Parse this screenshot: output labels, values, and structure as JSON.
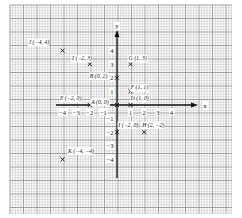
{
  "diagram": {
    "type": "coordinate-plane",
    "grid": {
      "left": 10,
      "top": 5,
      "right": 232,
      "bottom": 214,
      "minor_step": 2.7,
      "major_every": 5,
      "minor_color": "#bdbdbd",
      "major_color": "#8a8a8a",
      "paper_color": "#ffffff"
    },
    "origin_px": {
      "x": 117,
      "y": 105
    },
    "unit_px": 13.6,
    "axes": {
      "x_label": "x",
      "y_label": "y",
      "axis_color": "#111111",
      "x_start_px": 56,
      "x_end_px": 198,
      "y_top_px": 30,
      "y_bottom_px": 178,
      "x_ticks": [
        {
          "v": -4,
          "label": "−4"
        },
        {
          "v": -3,
          "label": "−3"
        },
        {
          "v": -2,
          "label": "−2"
        },
        {
          "v": -1,
          "label": "−1"
        },
        {
          "v": 1,
          "label": "1"
        },
        {
          "v": 2,
          "label": "2"
        },
        {
          "v": 3,
          "label": "3"
        },
        {
          "v": 4,
          "label": "4"
        }
      ],
      "y_ticks": [
        {
          "v": 4,
          "label": "4"
        },
        {
          "v": 3,
          "label": "3"
        },
        {
          "v": 2,
          "label": "2"
        },
        {
          "v": 1,
          "label": "1"
        },
        {
          "v": -1,
          "label": "−1"
        },
        {
          "v": -2,
          "label": "−2"
        },
        {
          "v": -3,
          "label": "−3"
        },
        {
          "v": -4,
          "label": "−4"
        }
      ]
    },
    "points": [
      {
        "id": "J",
        "label": "J (−4, 4)",
        "x": -4,
        "y": 4,
        "lx": -6.5,
        "ly": 4.5
      },
      {
        "id": "I1",
        "label": "I (−2, 3)",
        "x": -2,
        "y": 3,
        "lx": -3.3,
        "ly": 3.3
      },
      {
        "id": "G",
        "label": "G (1, 3)",
        "x": 1,
        "y": 3,
        "lx": 0.85,
        "ly": 3.3
      },
      {
        "id": "B",
        "label": "B (0, 2)",
        "x": 0,
        "y": 2,
        "lx": -2.0,
        "ly": 2.0
      },
      {
        "id": "F",
        "label": "F (1, 1)",
        "x": 1,
        "y": 1,
        "lx": 1.0,
        "ly": 1.15
      },
      {
        "id": "D",
        "label": "D (1, 0)",
        "x": 1,
        "y": 0,
        "lx": 1.0,
        "ly": 0.35
      },
      {
        "id": "E",
        "label": "E (−2, 0)",
        "x": -2,
        "y": 0,
        "lx": -4.2,
        "ly": 0.35
      },
      {
        "id": "A",
        "label": "A (0, 0)",
        "x": 0,
        "y": 0,
        "lx": -1.9,
        "ly": 0.1
      },
      {
        "id": "I2",
        "label": "I (−2, 0)",
        "x": 0,
        "y": -2,
        "lx": 0.1,
        "ly": -1.6
      },
      {
        "id": "H",
        "label": "H (2, −2)",
        "x": 2,
        "y": -2,
        "lx": 1.85,
        "ly": -1.6
      },
      {
        "id": "K",
        "label": "K (−4, −4)",
        "x": -4,
        "y": -4,
        "lx": -3.6,
        "ly": -3.5
      }
    ]
  }
}
